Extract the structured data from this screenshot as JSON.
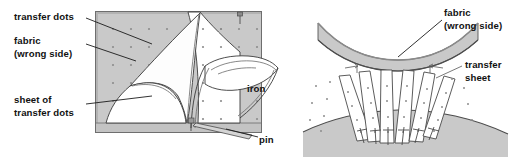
{
  "figure": {
    "width": 519,
    "height": 157,
    "background_color": "#ffffff"
  },
  "colors": {
    "fabric_gray": "#c9c9c9",
    "fabric_gray_dark": "#bdbdbd",
    "sheet_white": "#ffffff",
    "outline": "#3a3a3a",
    "leader": "#1b1b1b",
    "dot": "#8d8d8d",
    "text": "#111111"
  },
  "panels": [
    {
      "name": "left-panel",
      "labels": [
        {
          "id": "transfer-dots",
          "lines": [
            "transfer dots"
          ],
          "x": 14,
          "y": 16
        },
        {
          "id": "fabric-wrong-side",
          "lines": [
            "fabric",
            "(wrong side)"
          ],
          "x": 14,
          "y": 40
        },
        {
          "id": "sheet-of-transfer-dots",
          "lines": [
            "sheet of",
            "transfer dots"
          ],
          "x": 14,
          "y": 99
        },
        {
          "id": "iron",
          "lines": [
            "iron"
          ],
          "x": 247,
          "y": 88
        },
        {
          "id": "pin",
          "lines": [
            "pin"
          ],
          "x": 259,
          "y": 140
        }
      ]
    },
    {
      "name": "right-panel",
      "labels": [
        {
          "id": "fabric-wrong-side-right",
          "lines": [
            "fabric",
            "(wrong side)"
          ],
          "x": 444,
          "y": 12
        },
        {
          "id": "transfer-sheet",
          "lines": [
            "transfer",
            "sheet"
          ],
          "x": 465,
          "y": 64
        }
      ]
    }
  ],
  "left_panel": {
    "fabric_rect": {
      "x": 95,
      "y": 11,
      "width": 167,
      "height": 122
    },
    "dot_grid": {
      "spacing_x": 18,
      "spacing_y": 18,
      "radius": 1.1
    },
    "sheet_label": "sheet of transfer dots",
    "iron_label": "iron",
    "pin_label": "pin"
  },
  "right_panel": {
    "fabric_band_label": "fabric (wrong side)",
    "transfer_sheet_label": "transfer sheet",
    "strip_count": 6,
    "pin_count": 6
  }
}
